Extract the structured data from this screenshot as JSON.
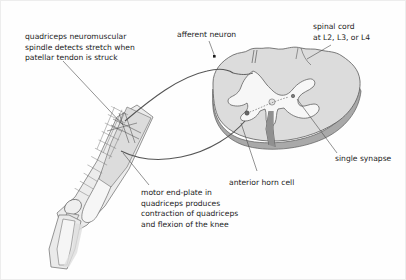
{
  "figure": {
    "background_color": "#fefefe",
    "text_color": "#1c1c1c",
    "line_color": "#4a4a4a"
  },
  "labels": {
    "spindle": {
      "name": "quadriceps-spindle-label",
      "lines": [
        "quadriceps neuromuscular",
        "spindle detects stretch when",
        "patellar tendon is struck"
      ]
    },
    "afferent": {
      "name": "afferent-neuron-label",
      "lines": [
        "afferent neuron"
      ]
    },
    "spinal_cord": {
      "name": "spinal-cord-label",
      "lines": [
        "spinal cord",
        "at L2, L3, or L4"
      ]
    },
    "synapse": {
      "name": "single-synapse-label",
      "lines": [
        "single synapse"
      ]
    },
    "anterior_horn": {
      "name": "anterior-horn-cell-label",
      "lines": [
        "anterior horn cell"
      ]
    },
    "motor_endplate": {
      "name": "motor-end-plate-label",
      "lines": [
        "motor end-plate in",
        "quadriceps produces",
        "contraction of quadriceps",
        "and flexion of the knee"
      ]
    }
  },
  "structures": {
    "spinal_cord": {
      "white_matter_fill": "#dcdcdc",
      "gray_matter_fill": "#f7f7f7",
      "cut_surface_fill": "#a9a9a9",
      "outline": "#5a5a5a"
    },
    "leg": {
      "skin_fill": "#e8e8e8",
      "muscle_fill": "#d9d9d9",
      "striation_color": "#6e6e6e",
      "outline": "#5f5f5f"
    },
    "nerve_path_color": "#555555"
  }
}
